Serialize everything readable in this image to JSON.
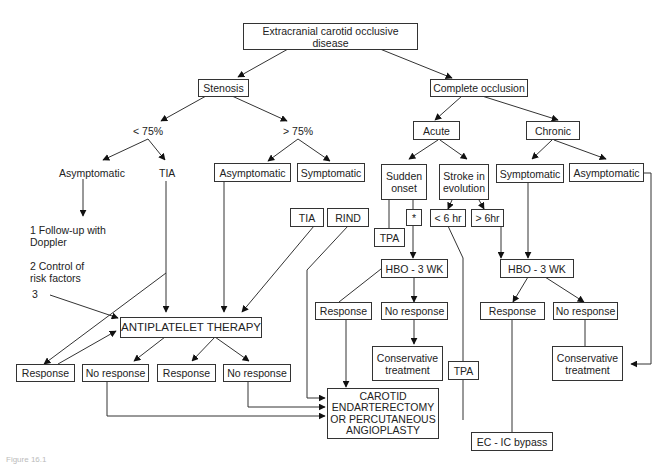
{
  "diagram": {
    "title": "Extracranial carotid occlusive disease",
    "caption": "Figure 16.1",
    "nodes": {
      "root": "Extracranial carotid occlusive disease",
      "stenosis": "Stenosis",
      "complete_occlusion": "Complete occlusion",
      "lt75": "< 75%",
      "gt75": "> 75%",
      "asym_lt75": "Asymptomatic",
      "tia_lt75": "TIA",
      "followup": "1 Follow-up with\n   Doppler",
      "control": "2 Control of\n   risk factors",
      "three": "3",
      "asym_gt75": "Asymptomatic",
      "sym_gt75": "Symptomatic",
      "tia_gt75": "TIA",
      "rind": "RIND",
      "acute": "Acute",
      "chronic": "Chronic",
      "sudden_onset": "Sudden\nonset",
      "stroke_evolution": "Stroke in\nevolution",
      "star": "*",
      "tpa_top": "TPA",
      "lt6hr": "< 6 hr",
      "gt6hr": "> 6hr",
      "sym_chronic": "Symptomatic",
      "asym_chronic": "Asymptomatic",
      "hbo_acute": "HBO - 3 WK",
      "hbo_chronic": "HBO - 3 WK",
      "antiplatelet": "ANTIPLATELET THERAPY",
      "resp_a": "Response",
      "noresp_a": "No response",
      "resp_b": "Response",
      "noresp_b": "No response",
      "resp_hbo_acute": "Response",
      "noresp_hbo_acute": "No response",
      "conservative_acute": "Conservative\ntreatment",
      "tpa_bottom": "TPA",
      "resp_hbo_chronic": "Response",
      "noresp_hbo_chronic": "No response",
      "conservative_chronic": "Conservative\ntreatment",
      "carotid": "CAROTID\nENDARTERECTOMY\nOR PERCUTANEOUS\nANGIOPLASTY",
      "ecic": "EC - IC bypass"
    }
  }
}
